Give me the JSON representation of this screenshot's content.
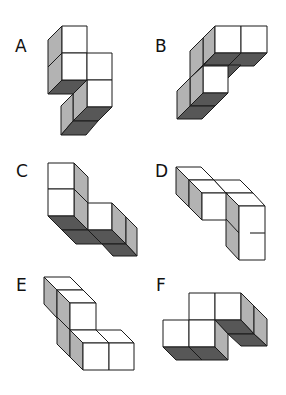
{
  "figure": {
    "title": "",
    "options": [
      {
        "label": "A"
      },
      {
        "label": "B"
      },
      {
        "label": "C"
      },
      {
        "label": "D"
      },
      {
        "label": "E"
      },
      {
        "label": "F"
      }
    ],
    "colors": {
      "face_front": "#ffffff",
      "face_side": "#b3b3b3",
      "face_bottom": "#575757",
      "edge": "#1a1a1a"
    }
  }
}
